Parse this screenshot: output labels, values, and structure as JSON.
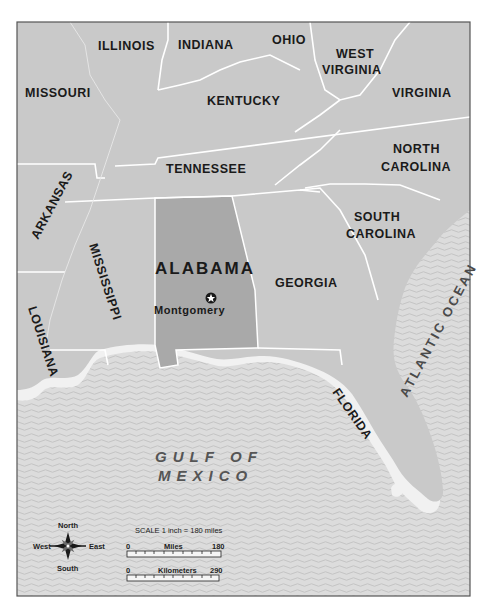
{
  "map": {
    "title": "Alabama and surrounding states",
    "colors": {
      "land": "#c9c9c9",
      "highlight_state": "#a9a9a9",
      "water": "#dcdcdc",
      "water_wave": "#c6c6c6",
      "coast_halo": "#f2f2f2",
      "border": "#ffffff",
      "frame": "#555555",
      "label": "#1a1a1a"
    },
    "highlighted_state": "ALABAMA",
    "states": [
      {
        "name": "ILLINOIS"
      },
      {
        "name": "INDIANA"
      },
      {
        "name": "OHIO"
      },
      {
        "name": "WEST VIRGINIA",
        "lines": [
          "WEST",
          "VIRGINIA"
        ]
      },
      {
        "name": "MISSOURI"
      },
      {
        "name": "KENTUCKY"
      },
      {
        "name": "VIRGINIA"
      },
      {
        "name": "NORTH CAROLINA",
        "lines": [
          "NORTH",
          "CAROLINA"
        ]
      },
      {
        "name": "TENNESSEE"
      },
      {
        "name": "ARKANSAS"
      },
      {
        "name": "SOUTH CAROLINA",
        "lines": [
          "SOUTH",
          "CAROLINA"
        ]
      },
      {
        "name": "MISSISSIPPI"
      },
      {
        "name": "ALABAMA"
      },
      {
        "name": "GEORGIA"
      },
      {
        "name": "LOUISIANA"
      },
      {
        "name": "FLORIDA"
      }
    ],
    "capital": {
      "name": "Montgomery",
      "icon": "star-in-circle-icon"
    },
    "water_bodies": [
      {
        "name": "GULF OF MEXICO",
        "lines": [
          "GULF OF",
          "MEXICO"
        ]
      },
      {
        "name": "ATLANTIC OCEAN"
      }
    ],
    "compass": {
      "north": "North",
      "south": "South",
      "east": "East",
      "west": "West",
      "icon": "compass-rose-icon"
    },
    "scale": {
      "title": "SCALE 1 inch = 180 miles",
      "miles": {
        "label": "Miles",
        "start": "0",
        "end": "180"
      },
      "kilometers": {
        "label": "Kilometers",
        "start": "0",
        "end": "290"
      }
    }
  }
}
